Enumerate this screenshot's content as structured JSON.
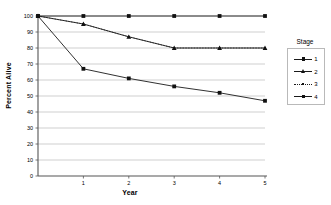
{
  "chart_data": {
    "type": "line",
    "title": "",
    "xlabel": "Year",
    "ylabel": "Percent Alive",
    "xlim": [
      0,
      5
    ],
    "ylim": [
      0,
      100
    ],
    "xticks": [
      "1",
      "2",
      "3",
      "4",
      "5"
    ],
    "yticks": [
      "0",
      "10",
      "20",
      "30",
      "40",
      "50",
      "60",
      "70",
      "80",
      "90",
      "100"
    ],
    "grid": "horizontal",
    "legend_title": "Stage",
    "legend_position": "right",
    "x": [
      0,
      1,
      2,
      3,
      4,
      5
    ],
    "series": [
      {
        "name": "1",
        "marker": "square",
        "linestyle": "solid",
        "color": "#1a1a1a",
        "values": [
          100,
          100,
          100,
          100,
          100,
          100
        ]
      },
      {
        "name": "2",
        "marker": "triangle",
        "linestyle": "solid",
        "color": "#1a1a1a",
        "values": [
          100,
          95,
          87,
          80,
          80,
          80
        ]
      },
      {
        "name": "3",
        "marker": "dot",
        "linestyle": "dotted",
        "color": "#1a1a1a",
        "values": [
          100,
          95,
          87,
          80,
          80,
          80
        ]
      },
      {
        "name": "4",
        "marker": "square",
        "linestyle": "solid",
        "color": "#1a1a1a",
        "values": [
          100,
          67,
          61,
          56,
          52,
          47
        ]
      }
    ]
  },
  "axis": {
    "ylabel": "Percent Alive",
    "xlabel": "Year"
  },
  "legend": {
    "title": "Stage",
    "entries": [
      {
        "label": "1"
      },
      {
        "label": "2"
      },
      {
        "label": "3"
      },
      {
        "label": "4"
      }
    ]
  }
}
